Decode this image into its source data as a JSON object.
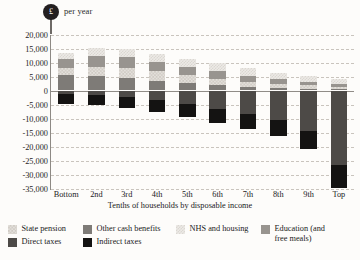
{
  "unit": {
    "symbol": "£",
    "label": "per year",
    "badge_color": "#231f20"
  },
  "chart_data": {
    "type": "bar",
    "stacked": true,
    "title": "",
    "subtitle": "",
    "xlabel": "Tenths of households by disposable income",
    "ylabel": "£ per year",
    "ylim": [
      -35000,
      20000
    ],
    "ytick_step": 5000,
    "grid": true,
    "legend_position": "bottom",
    "categories": [
      "Bottom",
      "2nd",
      "3rd",
      "4th",
      "5th",
      "6th",
      "7th",
      "8th",
      "9th",
      "Top"
    ],
    "ytick_labels": [
      "20,000",
      "15,000",
      "10,000",
      "5,000",
      "0",
      "-5,000",
      "-10,000",
      "-15,000",
      "-20,000",
      "-25,000",
      "-30,000",
      "-35,000"
    ],
    "ytick_values": [
      20000,
      15000,
      10000,
      5000,
      0,
      -5000,
      -10000,
      -15000,
      -20000,
      -25000,
      -30000,
      -35000
    ],
    "series": [
      {
        "name": "State pension",
        "key": "state-pension",
        "color": "#e3e0db",
        "pattern": "checker",
        "values": [
          2600,
          3100,
          3900,
          3500,
          2800,
          2300,
          1900,
          1500,
          1200,
          900
        ]
      },
      {
        "name": "Other cash benefits",
        "key": "other-cash",
        "color": "#7e7b77",
        "pattern": "solid",
        "values": [
          5600,
          5300,
          4300,
          3300,
          2600,
          1900,
          1300,
          900,
          700,
          500
        ]
      },
      {
        "name": "NHS and housing",
        "key": "nhs-housing",
        "color": "#eceae6",
        "pattern": "checker",
        "values": [
          2400,
          2800,
          2900,
          3100,
          2900,
          2800,
          2600,
          2300,
          2100,
          1800
        ]
      },
      {
        "name": "Education (and free meals)",
        "key": "education",
        "color": "#98948f",
        "pattern": "solid",
        "values": [
          2900,
          3900,
          3800,
          3300,
          3100,
          2700,
          2100,
          1700,
          1300,
          1000
        ]
      },
      {
        "name": "Direct taxes",
        "key": "direct-taxes",
        "color": "#4d4a47",
        "pattern": "solid",
        "values": [
          -1300,
          -1600,
          -2300,
          -3400,
          -4900,
          -6500,
          -8300,
          -10500,
          -14500,
          -26500
        ]
      },
      {
        "name": "Indirect taxes",
        "key": "indirect-taxes",
        "color": "#141312",
        "pattern": "solid",
        "values": [
          -3700,
          -3700,
          -4000,
          -4300,
          -4700,
          -5100,
          -5400,
          -5700,
          -6300,
          -8300
        ]
      }
    ]
  },
  "legend": [
    {
      "label": "State pension",
      "key": "state-pension",
      "swatch": "f-state-pension"
    },
    {
      "label": "Other cash benefits",
      "key": "other-cash",
      "swatch": "f-other-cash"
    },
    {
      "label": "NHS and housing",
      "key": "nhs-housing",
      "swatch": "f-nhs"
    },
    {
      "label": "Education (and free meals)",
      "key": "education",
      "swatch": "f-education"
    },
    {
      "label": "Direct taxes",
      "key": "direct-taxes",
      "swatch": "f-direct"
    },
    {
      "label": "Indirect taxes",
      "key": "indirect-taxes",
      "swatch": "f-indirect"
    }
  ]
}
